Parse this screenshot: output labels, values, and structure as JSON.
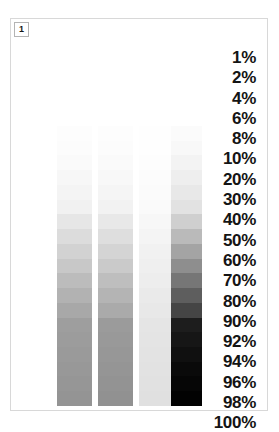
{
  "page": {
    "marker_number": "1",
    "background_color": "#ffffff",
    "border_color": "#d8d8d8"
  },
  "chart_data": {
    "type": "bar",
    "title": "",
    "subtitle": "",
    "xlabel": "",
    "ylabel": "",
    "grid": false,
    "legend_position": "none",
    "orientation": "vertical-stacked-tint-ramp",
    "categories": [
      "1%",
      "2%",
      "4%",
      "6%",
      "8%",
      "10%",
      "20%",
      "30%",
      "40%",
      "50%",
      "60%",
      "70%",
      "80%",
      "90%",
      "92%",
      "94%",
      "96%",
      "98%",
      "100%"
    ],
    "values": [
      1,
      2,
      4,
      6,
      8,
      10,
      20,
      30,
      40,
      50,
      60,
      70,
      80,
      90,
      92,
      94,
      96,
      98,
      100
    ],
    "ylim": [
      0,
      100
    ],
    "series": [
      {
        "name": "column-1-solid-gray",
        "screened": false,
        "values": [
          1,
          2,
          4,
          6,
          8,
          10,
          20,
          30,
          40,
          50,
          60,
          70,
          80,
          90,
          92,
          94,
          96,
          98,
          100
        ],
        "colors": [
          "#fdfdfd",
          "#fcfcfc",
          "#fafafa",
          "#f7f7f7",
          "#f4f4f4",
          "#f1f1f1",
          "#e6e6e6",
          "#dcdcdc",
          "#d2d2d2",
          "#c8c8c8",
          "#bcbcbc",
          "#b2b2b2",
          "#a8a8a8",
          "#9e9e9e",
          "#9c9c9c",
          "#9a9a9a",
          "#989898",
          "#969696",
          "#949494"
        ]
      },
      {
        "name": "column-2-screened-gray",
        "screened": true,
        "values": [
          1,
          2,
          4,
          6,
          8,
          10,
          20,
          30,
          40,
          50,
          60,
          70,
          80,
          90,
          92,
          94,
          96,
          98,
          100
        ],
        "colors": [
          "#fdfdfd",
          "#fcfcfc",
          "#fafafa",
          "#f8f8f8",
          "#f5f5f5",
          "#f2f2f2",
          "#e8e8e8",
          "#dedede",
          "#d4d4d4",
          "#cacaca",
          "#bebebe",
          "#b4b4b4",
          "#aaaaaa",
          "#9b9b9b",
          "#999999",
          "#979797",
          "#959595",
          "#939393",
          "#919191"
        ]
      },
      {
        "name": "column-3-light-yellow-tint",
        "screened": false,
        "values": [
          1,
          2,
          4,
          6,
          8,
          10,
          20,
          30,
          40,
          50,
          60,
          70,
          80,
          90,
          92,
          94,
          96,
          98,
          100
        ],
        "colors": [
          "#fefefe",
          "#fefefe",
          "#fdfdfd",
          "#fcfcfc",
          "#fbfbfb",
          "#fafafa",
          "#f7f7f7",
          "#f4f4f4",
          "#f1f1f1",
          "#efefef",
          "#ededed",
          "#eaeaea",
          "#e8e8e8",
          "#e5e5e5",
          "#e4e4e4",
          "#e3e3e3",
          "#e2e2e2",
          "#e1e1e1",
          "#e0e0e0"
        ]
      },
      {
        "name": "column-4-black",
        "screened": false,
        "values": [
          1,
          2,
          4,
          6,
          8,
          10,
          20,
          30,
          40,
          50,
          60,
          70,
          80,
          90,
          92,
          94,
          96,
          98,
          100
        ],
        "colors": [
          "#fbfbfb",
          "#f8f8f8",
          "#f3f3f3",
          "#eeeeee",
          "#e8e8e8",
          "#e2e2e2",
          "#cfcfcf",
          "#bababa",
          "#a4a4a4",
          "#8e8e8e",
          "#767676",
          "#5e5e5e",
          "#454545",
          "#1d1d1d",
          "#161616",
          "#101010",
          "#0a0a0a",
          "#060606",
          "#020202"
        ]
      }
    ]
  },
  "layout": {
    "column_left": [
      10,
      51,
      92,
      124
    ],
    "column_width": [
      35,
      35,
      32,
      31
    ],
    "label_right_offset": 11
  }
}
